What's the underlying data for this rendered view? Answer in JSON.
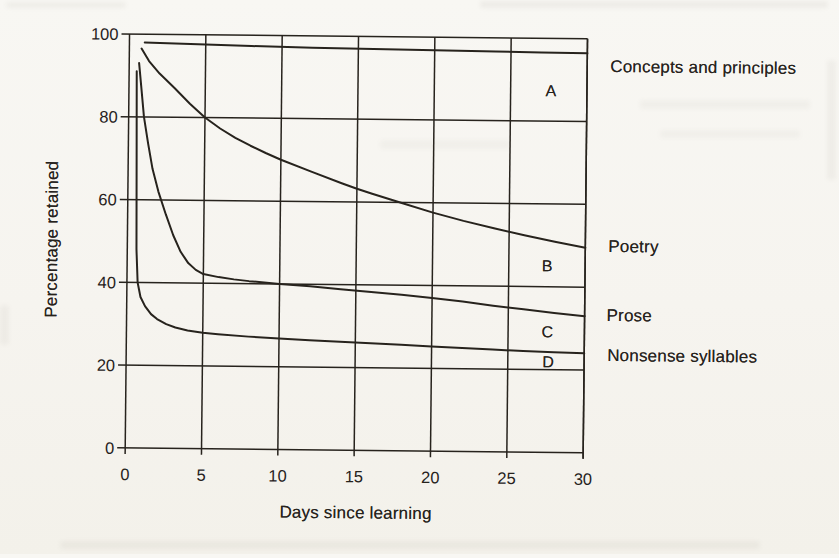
{
  "chart_data": {
    "type": "line",
    "title": "",
    "xlabel": "Days since learning",
    "ylabel": "Percentage retained",
    "xlim": [
      0,
      30
    ],
    "ylim": [
      0,
      100
    ],
    "x_ticks": [
      0,
      5,
      10,
      15,
      20,
      25,
      30
    ],
    "y_ticks": [
      100,
      80,
      60,
      40,
      20,
      0
    ],
    "grid": true,
    "legend_position": "right-outside",
    "series": [
      {
        "letter": "A",
        "name": "Concepts and principles",
        "points": [
          [
            1,
            98
          ],
          [
            4,
            97.7
          ],
          [
            8,
            97.4
          ],
          [
            12,
            97.15
          ],
          [
            16,
            96.95
          ],
          [
            20,
            96.8
          ],
          [
            24,
            96.7
          ],
          [
            27,
            96.6
          ],
          [
            30,
            96.5
          ]
        ]
      },
      {
        "letter": "B",
        "name": "Poetry",
        "points": [
          [
            0.8,
            96.5
          ],
          [
            1.3,
            93.5
          ],
          [
            2,
            90.5
          ],
          [
            3,
            87
          ],
          [
            4,
            83.3
          ],
          [
            5,
            80
          ],
          [
            6,
            77.4
          ],
          [
            7,
            75.2
          ],
          [
            8,
            73.3
          ],
          [
            9,
            71.6
          ],
          [
            10,
            70
          ],
          [
            12,
            67.2
          ],
          [
            14,
            64.5
          ],
          [
            15,
            63.2
          ],
          [
            16,
            62
          ],
          [
            18,
            59.8
          ],
          [
            20,
            57.6
          ],
          [
            22,
            55.7
          ],
          [
            24,
            54
          ],
          [
            26,
            52.4
          ],
          [
            28,
            50.9
          ],
          [
            30,
            49.5
          ]
        ]
      },
      {
        "letter": "C",
        "name": "Prose",
        "points": [
          [
            0.65,
            93
          ],
          [
            0.8,
            87.5
          ],
          [
            1,
            80
          ],
          [
            1.3,
            73.5
          ],
          [
            1.6,
            67.5
          ],
          [
            2,
            62
          ],
          [
            2.5,
            56.5
          ],
          [
            3,
            51.5
          ],
          [
            3.5,
            47.5
          ],
          [
            4,
            44.8
          ],
          [
            4.5,
            43.2
          ],
          [
            5,
            42.2
          ],
          [
            6,
            41.5
          ],
          [
            7,
            41
          ],
          [
            8,
            40.6
          ],
          [
            10,
            40
          ],
          [
            12,
            39.5
          ],
          [
            14,
            38.9
          ],
          [
            16,
            38.3
          ],
          [
            18,
            37.7
          ],
          [
            20,
            37
          ],
          [
            22,
            36.2
          ],
          [
            24,
            35.3
          ],
          [
            26,
            34.5
          ],
          [
            28,
            33.7
          ],
          [
            30,
            33
          ]
        ]
      },
      {
        "letter": "D",
        "name": "Nonsense syllables",
        "points": [
          [
            0.5,
            91
          ],
          [
            0.55,
            70
          ],
          [
            0.6,
            48
          ],
          [
            0.7,
            40
          ],
          [
            0.9,
            36.5
          ],
          [
            1.2,
            34.3
          ],
          [
            1.6,
            32.4
          ],
          [
            2,
            31.2
          ],
          [
            2.6,
            30
          ],
          [
            3.2,
            29.2
          ],
          [
            4,
            28.5
          ],
          [
            5,
            28
          ],
          [
            6,
            27.7
          ],
          [
            8,
            27.2
          ],
          [
            10,
            26.8
          ],
          [
            12,
            26.5
          ],
          [
            14,
            26.2
          ],
          [
            16,
            25.9
          ],
          [
            18,
            25.6
          ],
          [
            20,
            25.3
          ],
          [
            22,
            25
          ],
          [
            24,
            24.7
          ],
          [
            26,
            24.4
          ],
          [
            28,
            24.2
          ],
          [
            30,
            24
          ]
        ]
      }
    ]
  },
  "colors": {
    "ink": "#27231d",
    "paper": "#f6f4ef"
  }
}
